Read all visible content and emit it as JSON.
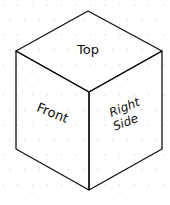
{
  "diagram": {
    "type": "isometric-cube",
    "faces": {
      "top": "Top",
      "front": "Front",
      "right_line1": "Right",
      "right_line2": "Side"
    },
    "colors": {
      "stroke": "#111111",
      "grid_dot": "#d9d9d9",
      "background": "#ffffff"
    }
  }
}
